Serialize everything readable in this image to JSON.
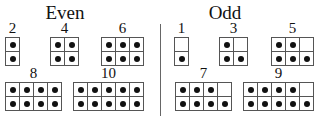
{
  "diagram": {
    "even": {
      "title": "Even",
      "items": [
        {
          "label": "2",
          "cols": 1,
          "rows": 2,
          "count": 2,
          "x": 5,
          "y": 21
        },
        {
          "label": "4",
          "cols": 2,
          "rows": 2,
          "count": 4,
          "x": 50,
          "y": 21
        },
        {
          "label": "6",
          "cols": 3,
          "rows": 2,
          "count": 6,
          "x": 101,
          "y": 21
        },
        {
          "label": "8",
          "cols": 4,
          "rows": 2,
          "count": 8,
          "x": 5,
          "y": 66
        },
        {
          "label": "10",
          "cols": 5,
          "rows": 2,
          "count": 10,
          "x": 73,
          "y": 66
        }
      ]
    },
    "odd": {
      "title": "Odd",
      "items": [
        {
          "label": "1",
          "cols": 1,
          "rows": 2,
          "count": 1,
          "x": 174,
          "y": 21
        },
        {
          "label": "3",
          "cols": 2,
          "rows": 2,
          "count": 3,
          "x": 219,
          "y": 21
        },
        {
          "label": "5",
          "cols": 3,
          "rows": 2,
          "count": 5,
          "x": 271,
          "y": 21
        },
        {
          "label": "7",
          "cols": 4,
          "rows": 2,
          "count": 7,
          "x": 175,
          "y": 66
        },
        {
          "label": "9",
          "cols": 5,
          "rows": 2,
          "count": 9,
          "x": 243,
          "y": 66
        }
      ]
    },
    "fill_rule": "bottom row filled first, left to right"
  }
}
